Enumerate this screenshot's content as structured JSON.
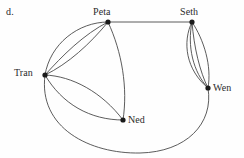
{
  "figure": {
    "part_label": "d.",
    "width": 244,
    "height": 158,
    "stroke_color": "#4a4a4a",
    "node_color": "#1a1a1a",
    "background_color": "#fefefe"
  },
  "graph": {
    "type": "multigraph",
    "nodes": [
      {
        "id": "peta",
        "label": "Peta",
        "x": 108,
        "y": 22,
        "label_x": 93,
        "label_y": 6,
        "degree": 5
      },
      {
        "id": "seth",
        "label": "Seth",
        "x": 192,
        "y": 22,
        "label_x": 180,
        "label_y": 6,
        "degree": 5
      },
      {
        "id": "tran",
        "label": "Tran",
        "x": 45,
        "y": 75,
        "label_x": 14,
        "label_y": 67,
        "degree": 6
      },
      {
        "id": "ned",
        "label": "Ned",
        "x": 123,
        "y": 120,
        "label_x": 128,
        "label_y": 114,
        "degree": 3
      },
      {
        "id": "wen",
        "label": "Wen",
        "x": 208,
        "y": 88,
        "label_x": 213,
        "label_y": 82,
        "degree": 5
      }
    ],
    "edges": [
      {
        "from": "peta",
        "to": "tran",
        "multiplicity_index": 1,
        "shape": "curve-outer-left",
        "path": "M 108 22 C 78 22 50 44 45 75"
      },
      {
        "from": "peta",
        "to": "tran",
        "multiplicity_index": 2,
        "shape": "curve-mid",
        "path": "M 108 22 C 84 34 62 56 45 75"
      },
      {
        "from": "peta",
        "to": "tran",
        "multiplicity_index": 3,
        "shape": "curve-inner",
        "path": "M 108 22 C 90 44 68 64 45 75"
      },
      {
        "from": "peta",
        "to": "seth",
        "multiplicity_index": 1,
        "shape": "straight",
        "path": "M 108 22 L 192 22"
      },
      {
        "from": "peta",
        "to": "ned",
        "multiplicity_index": 1,
        "shape": "curve-right-bulge",
        "path": "M 108 22 C 122 52 128 88 123 120"
      },
      {
        "from": "tran",
        "to": "ned",
        "multiplicity_index": 1,
        "shape": "curve-upper",
        "path": "M 45 75 C 72 76 102 92 123 120"
      },
      {
        "from": "tran",
        "to": "ned",
        "multiplicity_index": 2,
        "shape": "curve-lower",
        "path": "M 45 75 C 62 104 90 120 123 120"
      },
      {
        "from": "seth",
        "to": "wen",
        "multiplicity_index": 1,
        "shape": "curve-leftmost",
        "path": "M 192 22 C 182 42 186 70 208 88"
      },
      {
        "from": "seth",
        "to": "wen",
        "multiplicity_index": 2,
        "shape": "curve-left-mid",
        "path": "M 192 22 C 187 46 193 72 208 88"
      },
      {
        "from": "seth",
        "to": "wen",
        "multiplicity_index": 3,
        "shape": "curve-right-mid",
        "path": "M 192 22 C 194 48 200 72 208 88"
      },
      {
        "from": "seth",
        "to": "wen",
        "multiplicity_index": 4,
        "shape": "curve-rightmost",
        "path": "M 192 22 C 204 40 212 66 208 88"
      },
      {
        "from": "tran",
        "to": "wen",
        "multiplicity_index": 1,
        "shape": "large-bottom-arc",
        "path": "M 45 75 C 38 128 90 154 140 153 C 186 152 214 124 208 88"
      }
    ],
    "edge_count": 12,
    "node_count": 5
  }
}
